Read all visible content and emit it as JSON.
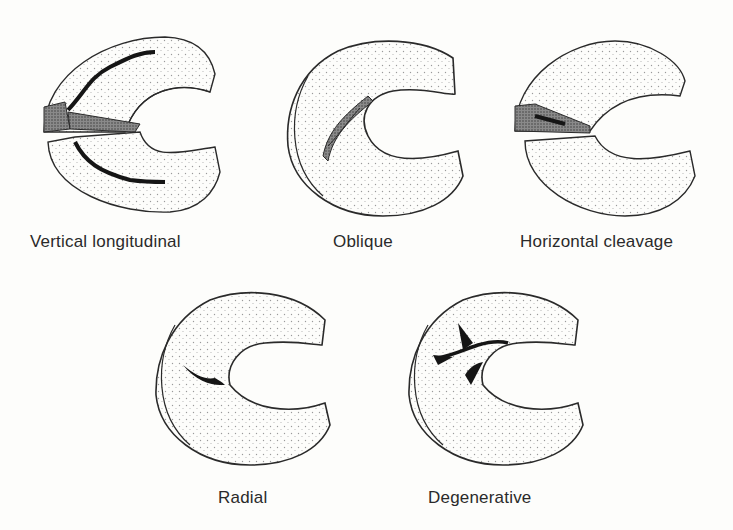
{
  "diagrams": [
    {
      "id": "vertical-longitudinal",
      "label": "Vertical longitudinal"
    },
    {
      "id": "oblique",
      "label": "Oblique"
    },
    {
      "id": "horizontal-cleavage",
      "label": "Horizontal cleavage"
    },
    {
      "id": "radial",
      "label": "Radial"
    },
    {
      "id": "degenerative",
      "label": "Degenerative"
    }
  ],
  "colors": {
    "ink": "#2a2a2a",
    "stipple": "#9a9a9a",
    "tear": "#151515",
    "background": "#fdfdfb"
  }
}
